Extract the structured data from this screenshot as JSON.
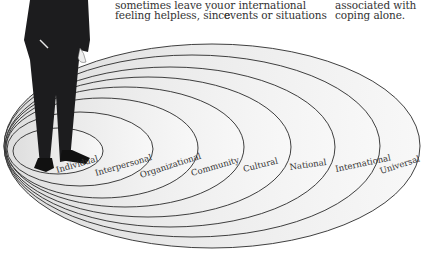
{
  "text_columns": [
    {
      "lines": [
        "sometimes leave you",
        "feeling helpless, since"
      ]
    },
    {
      "lines": [
        "or international",
        "events or situations"
      ]
    },
    {
      "lines": [
        "associated with",
        "coping alone."
      ]
    }
  ],
  "diagram": {
    "figure": "man in dark suit standing in the innermost ellipse",
    "levels": [
      {
        "label": "Individual"
      },
      {
        "label": "Interpersonal"
      },
      {
        "label": "Organizational"
      },
      {
        "label": "Community"
      },
      {
        "label": "Cultural"
      },
      {
        "label": "National"
      },
      {
        "label": "International"
      },
      {
        "label": "Universal"
      }
    ],
    "colors": {
      "stroke": "#2a2a2a",
      "fill_inner": "#e4e4e4",
      "fill_outer": "#f6f6f6",
      "suit": "#1c1c1e"
    }
  }
}
